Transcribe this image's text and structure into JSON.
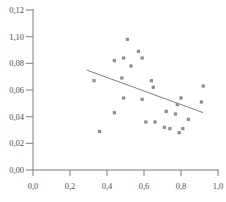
{
  "chart_data": {
    "type": "scatter",
    "title": "",
    "xlabel": "",
    "ylabel": "",
    "xlim": [
      0,
      1.0
    ],
    "ylim": [
      0,
      0.12
    ],
    "grid": false,
    "marker_shape": "square",
    "decimal_separator": "comma",
    "x_ticks": [
      {
        "v": 0.0,
        "label": "0,0"
      },
      {
        "v": 0.2,
        "label": "0,2"
      },
      {
        "v": 0.4,
        "label": "0,4"
      },
      {
        "v": 0.6,
        "label": "0,6"
      },
      {
        "v": 0.8,
        "label": "0,8"
      },
      {
        "v": 1.0,
        "label": "1,0"
      }
    ],
    "y_ticks": [
      {
        "v": 0.0,
        "label": "0,00"
      },
      {
        "v": 0.02,
        "label": "0,02"
      },
      {
        "v": 0.04,
        "label": "0,04"
      },
      {
        "v": 0.06,
        "label": "0,06"
      },
      {
        "v": 0.08,
        "label": "0,08"
      },
      {
        "v": 0.1,
        "label": "1,10"
      },
      {
        "v": 0.12,
        "label": "0,12"
      }
    ],
    "points": [
      [
        0.51,
        0.098
      ],
      [
        0.57,
        0.089
      ],
      [
        0.49,
        0.084
      ],
      [
        0.44,
        0.082
      ],
      [
        0.59,
        0.084
      ],
      [
        0.53,
        0.078
      ],
      [
        0.48,
        0.069
      ],
      [
        0.33,
        0.067
      ],
      [
        0.64,
        0.067
      ],
      [
        0.65,
        0.062
      ],
      [
        0.92,
        0.063
      ],
      [
        0.49,
        0.054
      ],
      [
        0.59,
        0.053
      ],
      [
        0.8,
        0.054
      ],
      [
        0.91,
        0.051
      ],
      [
        0.44,
        0.043
      ],
      [
        0.72,
        0.044
      ],
      [
        0.78,
        0.049
      ],
      [
        0.77,
        0.042
      ],
      [
        0.61,
        0.036
      ],
      [
        0.66,
        0.036
      ],
      [
        0.84,
        0.038
      ],
      [
        0.71,
        0.032
      ],
      [
        0.74,
        0.031
      ],
      [
        0.81,
        0.031
      ],
      [
        0.36,
        0.029
      ],
      [
        0.79,
        0.028
      ]
    ],
    "trend_line": {
      "x1": 0.29,
      "y1": 0.075,
      "x2": 0.92,
      "y2": 0.043
    },
    "colors": {
      "marker": "#8c8c8c",
      "trend_line": "#707070",
      "axis": "#7d7d7d",
      "tick_text": "#4d4d4d",
      "background": "#ffffff"
    }
  }
}
